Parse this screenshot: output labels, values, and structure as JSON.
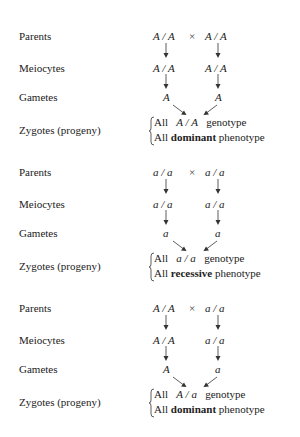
{
  "row_labels": {
    "parents": "Parents",
    "meiocytes": "Meiocytes",
    "gametes": "Gametes",
    "zygotes": "Zygotes (progeny)"
  },
  "cross_symbol": "×",
  "crosses": [
    {
      "parent_left": "A / A",
      "parent_right": "A / A",
      "meiocyte_left": "A / A",
      "meiocyte_right": "A / A",
      "gamete_left": "A",
      "gamete_right": "A",
      "result_all": "All",
      "result_genotype": "A / A",
      "result_genotype_suffix": "genotype",
      "result_phenotype_prefix": "All",
      "result_phenotype": "dominant",
      "result_phenotype_suffix": "phenotype"
    },
    {
      "parent_left": "a / a",
      "parent_right": "a / a",
      "meiocyte_left": "a / a",
      "meiocyte_right": "a / a",
      "gamete_left": "a",
      "gamete_right": "a",
      "result_all": "All",
      "result_genotype": "a / a",
      "result_genotype_suffix": "genotype",
      "result_phenotype_prefix": "All",
      "result_phenotype": "recessive",
      "result_phenotype_suffix": "phenotype"
    },
    {
      "parent_left": "A / A",
      "parent_right": "a / a",
      "meiocyte_left": "A / A",
      "meiocyte_right": "a / a",
      "gamete_left": "A",
      "gamete_right": "a",
      "result_all": "All",
      "result_genotype": "A / a",
      "result_genotype_suffix": "genotype",
      "result_phenotype_prefix": "All",
      "result_phenotype": "dominant",
      "result_phenotype_suffix": "phenotype"
    }
  ]
}
